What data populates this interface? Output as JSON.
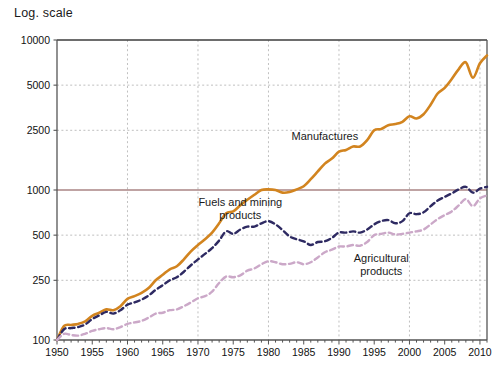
{
  "chart_data": {
    "type": "line",
    "title": "Log. scale",
    "xlabel": "",
    "ylabel": "",
    "log_scale": true,
    "grid": true,
    "legend_position": "inline-annotations",
    "xlim": [
      1950,
      2011
    ],
    "ylim": [
      100,
      10000
    ],
    "ytick_labels": [
      "10000",
      "5000",
      "2500",
      "1000",
      "500",
      "250",
      "100"
    ],
    "ytick_values": [
      10000,
      5000,
      2500,
      1000,
      500,
      250,
      100
    ],
    "xtick_labels": [
      "1950",
      "1955",
      "1960",
      "1965",
      "1970",
      "1975",
      "1980",
      "1985",
      "1990",
      "1995",
      "2000",
      "2005",
      "2010"
    ],
    "xtick_values": [
      1950,
      1955,
      1960,
      1965,
      1970,
      1975,
      1980,
      1985,
      1990,
      1995,
      2000,
      2005,
      2010
    ],
    "reference_line": {
      "value": 1000,
      "color": "#6b2b2b"
    },
    "colors": {
      "manufactures": "#d2841f",
      "fuels_and_mining": "#2e2a62",
      "agricultural": "#cba8c8",
      "gridline": "#b9b9b9",
      "axis": "#555555"
    },
    "series": [
      {
        "name": "Manufactures",
        "color": "#d2841f",
        "style": "solid",
        "label_x": 1988,
        "label_y": 2150,
        "x": [
          1950,
          1951,
          1952,
          1953,
          1954,
          1955,
          1956,
          1957,
          1958,
          1959,
          1960,
          1961,
          1962,
          1963,
          1964,
          1965,
          1966,
          1967,
          1968,
          1969,
          1970,
          1971,
          1972,
          1973,
          1974,
          1975,
          1976,
          1977,
          1978,
          1979,
          1980,
          1981,
          1982,
          1983,
          1984,
          1985,
          1986,
          1987,
          1988,
          1989,
          1990,
          1991,
          1992,
          1993,
          1994,
          1995,
          1996,
          1997,
          1998,
          1999,
          2000,
          2001,
          2002,
          2003,
          2004,
          2005,
          2006,
          2007,
          2008,
          2009,
          2010,
          2011
        ],
        "values": [
          100,
          124,
          126,
          128,
          133,
          145,
          152,
          160,
          158,
          168,
          188,
          196,
          206,
          222,
          250,
          272,
          296,
          310,
          345,
          390,
          430,
          470,
          520,
          600,
          700,
          720,
          790,
          860,
          930,
          1000,
          1010,
          1000,
          960,
          970,
          1010,
          1060,
          1180,
          1330,
          1500,
          1620,
          1800,
          1850,
          1950,
          1950,
          2150,
          2500,
          2550,
          2700,
          2750,
          2850,
          3100,
          3000,
          3200,
          3700,
          4400,
          4800,
          5500,
          6400,
          7100,
          5600,
          7000,
          7900
        ]
      },
      {
        "name": "Fuels and mining products",
        "color": "#2e2a62",
        "style": "dashed",
        "label_x": 1976,
        "label_y": 780,
        "label_line2": "products",
        "x": [
          1950,
          1951,
          1952,
          1953,
          1954,
          1955,
          1956,
          1957,
          1958,
          1959,
          1960,
          1961,
          1962,
          1963,
          1964,
          1965,
          1966,
          1967,
          1968,
          1969,
          1970,
          1971,
          1972,
          1973,
          1974,
          1975,
          1976,
          1977,
          1978,
          1979,
          1980,
          1981,
          1982,
          1983,
          1984,
          1985,
          1986,
          1987,
          1988,
          1989,
          1990,
          1991,
          1992,
          1993,
          1994,
          1995,
          1996,
          1997,
          1998,
          1999,
          2000,
          2001,
          2002,
          2003,
          2004,
          2005,
          2006,
          2007,
          2008,
          2009,
          2010,
          2011
        ],
        "values": [
          100,
          118,
          120,
          122,
          127,
          138,
          146,
          154,
          150,
          158,
          172,
          178,
          186,
          198,
          216,
          232,
          250,
          262,
          285,
          315,
          345,
          375,
          410,
          460,
          530,
          510,
          545,
          570,
          570,
          600,
          620,
          590,
          540,
          490,
          470,
          455,
          430,
          450,
          455,
          480,
          520,
          520,
          530,
          520,
          545,
          590,
          620,
          630,
          600,
          620,
          700,
          690,
          710,
          780,
          850,
          900,
          950,
          1010,
          1050,
          960,
          1020,
          1050
        ]
      },
      {
        "name": "Agricultural products",
        "color": "#cba8c8",
        "style": "dashed",
        "label_x": 1996,
        "label_y": 330,
        "label_line2": "products",
        "x": [
          1950,
          1951,
          1952,
          1953,
          1954,
          1955,
          1956,
          1957,
          1958,
          1959,
          1960,
          1961,
          1962,
          1963,
          1964,
          1965,
          1966,
          1967,
          1968,
          1969,
          1970,
          1971,
          1972,
          1973,
          1974,
          1975,
          1976,
          1977,
          1978,
          1979,
          1980,
          1981,
          1982,
          1983,
          1984,
          1985,
          1986,
          1987,
          1988,
          1989,
          1990,
          1991,
          1992,
          1993,
          1994,
          1995,
          1996,
          1997,
          1998,
          1999,
          2000,
          2001,
          2002,
          2003,
          2004,
          2005,
          2006,
          2007,
          2008,
          2009,
          2010,
          2011
        ],
        "values": [
          100,
          110,
          108,
          107,
          110,
          115,
          118,
          120,
          118,
          122,
          128,
          131,
          134,
          141,
          150,
          152,
          158,
          160,
          168,
          178,
          190,
          196,
          210,
          240,
          265,
          262,
          270,
          290,
          300,
          320,
          335,
          330,
          320,
          322,
          330,
          320,
          330,
          355,
          385,
          400,
          420,
          420,
          430,
          425,
          450,
          500,
          510,
          520,
          505,
          510,
          520,
          530,
          545,
          590,
          640,
          680,
          720,
          790,
          870,
          780,
          880,
          920
        ]
      }
    ]
  }
}
